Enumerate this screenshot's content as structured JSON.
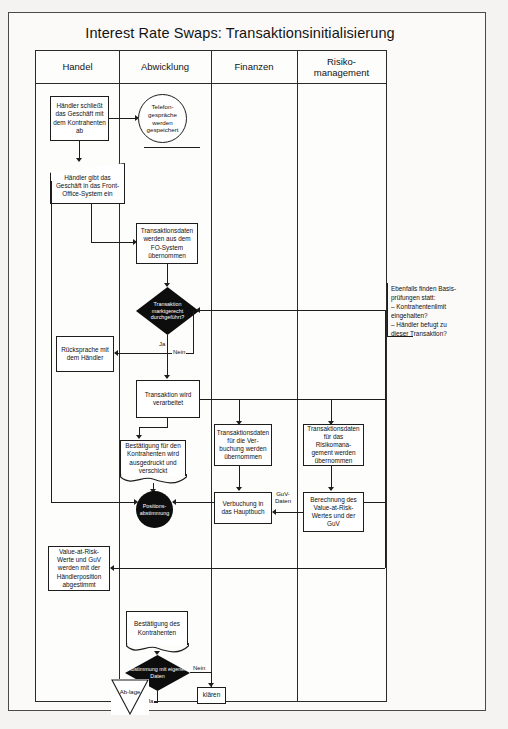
{
  "title": "Interest Rate Swaps: Transaktionsinitialisierung",
  "lanes": [
    {
      "id": "handel",
      "label": "Handel"
    },
    {
      "id": "abwicklung",
      "label": "Abwicklung"
    },
    {
      "id": "finanzen",
      "label": "Finanzen"
    },
    {
      "id": "risikomanagement",
      "label": "Risiko-\nmanagement"
    }
  ],
  "nodes": {
    "haendler_schliesst": "Händler schließt das Geschäft mit dem Kontrahenten ab",
    "telefongespraeche": "Telefon-gespräche werden gespeichert",
    "haendler_gibt": "Händler gibt das Geschäft in das Front-Office-System ein",
    "transaktionsdaten_fo": "Transaktionsdaten werden aus dem FO-System übernommen",
    "decision_marktgerecht": "Transaktion marktgerecht durchgeführt?",
    "ruecksprache": "Rücksprache mit dem Händler",
    "transaktion_verarbeitet": "Transaktion wird verarbeitet",
    "bestaetigung_kontrahenten_doc": "Bestätigung für den Kontrahenten wird ausgedruckt und verschickt",
    "positionsabstimmung": "Positions-abstimmung",
    "value_at_risk_abgestimmt": "Value-at-Risk-Werte und GuV werden mit der Händlerposition abgestimmt",
    "bestaetigung_des_kontrahenten": "Bestätigung des Kontrahenten",
    "decision_abstimmung": "Abstimmung mit eigenen Daten",
    "ablage": "Ab-lage",
    "klaeren": "klären",
    "transaktionsdaten_verbuchung": "Transaktionsdaten für die Ver-buchung werden übernommen",
    "verbuchung_hauptbuch": "Verbuchung in das Hauptbuch",
    "transaktionsdaten_risiko": "Transaktionsdaten für das Risikomana-gement werden übernommen",
    "berechnung_var": "Berechnung des Value-at-Risk-Wertes und der GuV"
  },
  "edge_labels": {
    "ja_1": "Ja",
    "nein_1": "Nein",
    "guv_daten": "GuV-\nDaten",
    "ja_2": "Ja",
    "nein_2": "Nein"
  },
  "annotation": {
    "text": "Ebenfalls finden Basis-\nprüfungen statt:\n–  Kontrahentenlimit\n    eingehalten?\n–  Händler befugt zu\n    dieser Transaktion?"
  },
  "colors": {
    "page_bg": "#f4f3f1",
    "panel_bg": "#fbfaf8",
    "line": "#1d1d1d",
    "fill_black": "#0d0d0d",
    "text": "#111111"
  }
}
